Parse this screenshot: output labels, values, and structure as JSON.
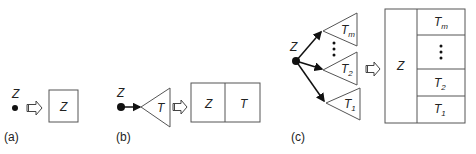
{
  "panels": {
    "a": {
      "caption": "(a)",
      "node_label": "Z",
      "box_label": "Z"
    },
    "b": {
      "caption": "(b)",
      "node_label": "Z",
      "triangle_label": "T",
      "box_cells": [
        "Z",
        "T"
      ]
    },
    "c": {
      "caption": "(c)",
      "node_label": "Z",
      "triangles": [
        {
          "label": "T",
          "sub": "m"
        },
        {
          "label": "T",
          "sub": "2"
        },
        {
          "label": "T",
          "sub": "1"
        }
      ],
      "box_left": "Z",
      "box_right": [
        {
          "label": "T",
          "sub": "m"
        },
        {
          "label": "⋮",
          "sub": ""
        },
        {
          "label": "T",
          "sub": "2"
        },
        {
          "label": "T",
          "sub": "1"
        }
      ]
    }
  },
  "colors": {
    "stroke": "#333333",
    "fill": "#111111"
  }
}
